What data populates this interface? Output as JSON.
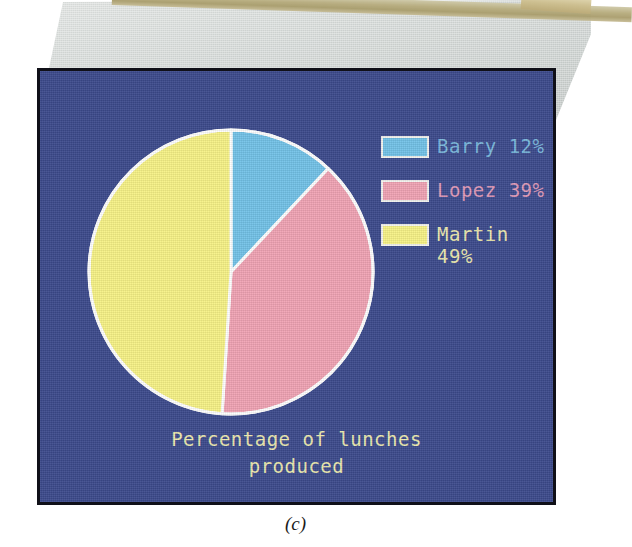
{
  "scene": {
    "description": "photo-of-crt-monitor",
    "bezel_color": "#d6dad8",
    "desk_bar_color": "#b7ac7d",
    "screen_bg": "#3c4a8c",
    "screen_border": "#101018"
  },
  "chart_data": {
    "type": "pie",
    "title": "Percentage of lunches produced",
    "categories": [
      "Barry",
      "Lopez",
      "Martin"
    ],
    "values": [
      12,
      39,
      49
    ],
    "unit": "%",
    "start_angle_deg": 0,
    "direction": "clockwise",
    "slice_colors": [
      "#72c2e8",
      "#f0a3b4",
      "#f7f286"
    ],
    "slice_border_color": "#ffffff",
    "legend_position": "right",
    "legend": [
      {
        "label": "Barry 12%",
        "swatch": "#72c2e8",
        "text_color": "#7ab8dc"
      },
      {
        "label": "Lopez 39%",
        "swatch": "#f0a3b4",
        "text_color": "#e09ab8"
      },
      {
        "label": "Martin\n49%",
        "swatch": "#f7f286",
        "text_color": "#ece9ae"
      }
    ],
    "slices": [
      {
        "name": "Barry",
        "value": 12,
        "color": "#72c2e8",
        "start_deg": 0,
        "end_deg": 43.2
      },
      {
        "name": "Lopez",
        "value": 39,
        "color": "#f0a3b4",
        "start_deg": 43.2,
        "end_deg": 183.6
      },
      {
        "name": "Martin",
        "value": 49,
        "color": "#f7f286",
        "start_deg": 183.6,
        "end_deg": 360
      }
    ],
    "grid": false,
    "xlabel": "",
    "ylabel": ""
  },
  "screen": {
    "caption": "Percentage of lunches\nproduced",
    "caption_color": "#ece9ae"
  },
  "figure": {
    "label": "(c)"
  }
}
